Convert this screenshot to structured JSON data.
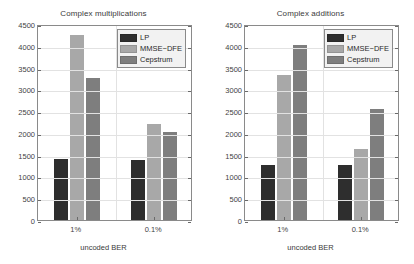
{
  "figure": {
    "background": "#ffffff",
    "axis_color": "#8a8a8a",
    "grid_color": "#e2e2e2",
    "text_color": "#3a3a3a"
  },
  "series_colors": {
    "LP": "#2e2e2e",
    "MMSE-DFE": "#a8a8a8",
    "Cepstrum": "#7e7e7e"
  },
  "legend": {
    "position": "top-right",
    "entries": [
      {
        "label": "LP",
        "color": "#2e2e2e"
      },
      {
        "label": "MMSE−DFE",
        "color": "#a8a8a8"
      },
      {
        "label": "Cepstrum",
        "color": "#7e7e7e"
      }
    ]
  },
  "axis": {
    "yticks": [
      0,
      500,
      1000,
      1500,
      2000,
      2500,
      3000,
      3500,
      4000,
      4500
    ],
    "ytick_labels": [
      "0",
      "500",
      "1000",
      "1500",
      "2000",
      "2500",
      "3000",
      "3500",
      "4000",
      "4500"
    ],
    "ylim": [
      0,
      4500
    ],
    "xtick_labels": [
      "1%",
      "0.1%"
    ],
    "xlabel": "uncoded BER",
    "grid": true
  },
  "chart_data": [
    {
      "id": "complex-multiplications",
      "type": "bar",
      "title": "Complex multiplications",
      "xlabel": "uncoded BER",
      "ylabel": "",
      "categories": [
        "1%",
        "0.1%"
      ],
      "ylim": [
        0,
        4500
      ],
      "yticks": [
        0,
        500,
        1000,
        1500,
        2000,
        2500,
        3000,
        3500,
        4000,
        4500
      ],
      "grid": true,
      "legend_position": "top-right",
      "series": [
        {
          "name": "LP",
          "color": "#2e2e2e",
          "values": [
            1400,
            1380
          ]
        },
        {
          "name": "MMSE−DFE",
          "color": "#a8a8a8",
          "values": [
            4250,
            2200
          ]
        },
        {
          "name": "Cepstrum",
          "color": "#7e7e7e",
          "values": [
            3250,
            2030
          ]
        }
      ]
    },
    {
      "id": "complex-additions",
      "type": "bar",
      "title": "Complex additions",
      "xlabel": "uncoded BER",
      "ylabel": "",
      "categories": [
        "1%",
        "0.1%"
      ],
      "ylim": [
        0,
        4500
      ],
      "yticks": [
        0,
        500,
        1000,
        1500,
        2000,
        2500,
        3000,
        3500,
        4000,
        4500
      ],
      "grid": true,
      "legend_position": "top-right",
      "series": [
        {
          "name": "LP",
          "color": "#2e2e2e",
          "values": [
            1265,
            1255
          ]
        },
        {
          "name": "MMSE−DFE",
          "color": "#a8a8a8",
          "values": [
            3330,
            1620
          ]
        },
        {
          "name": "Cepstrum",
          "color": "#7e7e7e",
          "values": [
            4020,
            2550
          ]
        }
      ]
    }
  ]
}
